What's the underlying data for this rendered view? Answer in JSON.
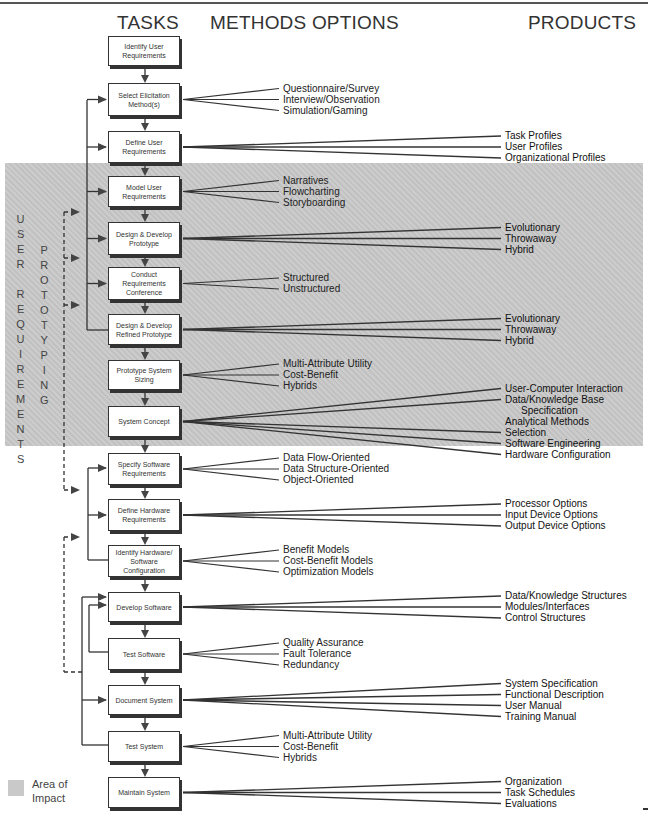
{
  "headers": {
    "tasks": "TASKS",
    "methods": "METHODS OPTIONS",
    "products": "PRODUCTS"
  },
  "side_labels": {
    "user_requirements": "USER REQUIREMENTS",
    "prototyping": "PROTOTYPING"
  },
  "legend": {
    "label": "Area of Impact",
    "line1": "Area of",
    "line2": "Impact"
  },
  "tasks": [
    {
      "label": "Identify User Requirements",
      "methods": [],
      "products": []
    },
    {
      "label": "Select Elicitation Method(s)",
      "methods": [
        "Questionnaire/Survey",
        "Interview/Observation",
        "Simulation/Gaming"
      ],
      "products": []
    },
    {
      "label": "Define User Requirements",
      "methods": [],
      "products": [
        "Task Profiles",
        "User Profiles",
        "Organizational Profiles"
      ]
    },
    {
      "label": "Model User Requirements",
      "methods": [
        "Narratives",
        "Flowcharting",
        "Storyboarding"
      ],
      "products": []
    },
    {
      "label": "Design & Develop Prototype",
      "methods": [],
      "products": [
        "Evolutionary",
        "Throwaway",
        "Hybrid"
      ]
    },
    {
      "label": "Conduct Requirements Conference",
      "methods": [
        "Structured",
        "Unstructured"
      ],
      "products": []
    },
    {
      "label": "Design & Develop Refined Prototype",
      "methods": [],
      "products": [
        "Evolutionary",
        "Throwaway",
        "Hybrid"
      ]
    },
    {
      "label": "Prototype System Sizing",
      "methods": [
        "Multi-Attribute Utility",
        "Cost-Benefit",
        "Hybrids"
      ],
      "products": []
    },
    {
      "label": "System Concept",
      "methods": [],
      "products": [
        "User-Computer Interaction",
        "Data/Knowledge Base",
        "Specification",
        "Analytical Methods",
        "Selection",
        "Software Engineering",
        "Hardware Configuration"
      ]
    },
    {
      "label": "Specify Software Requirements",
      "methods": [
        "Data Flow-Oriented",
        "Data Structure-Oriented",
        "Object-Oriented"
      ],
      "products": []
    },
    {
      "label": "Define Hardware Requirements",
      "methods": [],
      "products": [
        "Processor Options",
        "Input Device Options",
        "Output Device Options"
      ]
    },
    {
      "label": "Identify Hardware/ Software Configuration",
      "methods": [
        "Benefit Models",
        "Cost-Benefit Models",
        "Optimization Models"
      ],
      "products": []
    },
    {
      "label": "Develop Software",
      "methods": [],
      "products": [
        "Data/Knowledge Structures",
        "Modules/Interfaces",
        "Control Structures"
      ]
    },
    {
      "label": "Test Software",
      "methods": [
        "Quality Assurance",
        "Fault Tolerance",
        "Redundancy"
      ],
      "products": []
    },
    {
      "label": "Document System",
      "methods": [],
      "products": [
        "System Specification",
        "Functional Description",
        "User Manual",
        "Training Manual"
      ]
    },
    {
      "label": "Test System",
      "methods": [
        "Multi-Attribute Utility",
        "Cost-Benefit",
        "Hybrids"
      ],
      "products": []
    },
    {
      "label": "Maintain System",
      "methods": [],
      "products": [
        "Organization",
        "Task Schedules",
        "Evaluations"
      ]
    }
  ],
  "colors": {
    "shade": "#c9c9c9",
    "line": "#333333",
    "box_border": "#333333"
  }
}
